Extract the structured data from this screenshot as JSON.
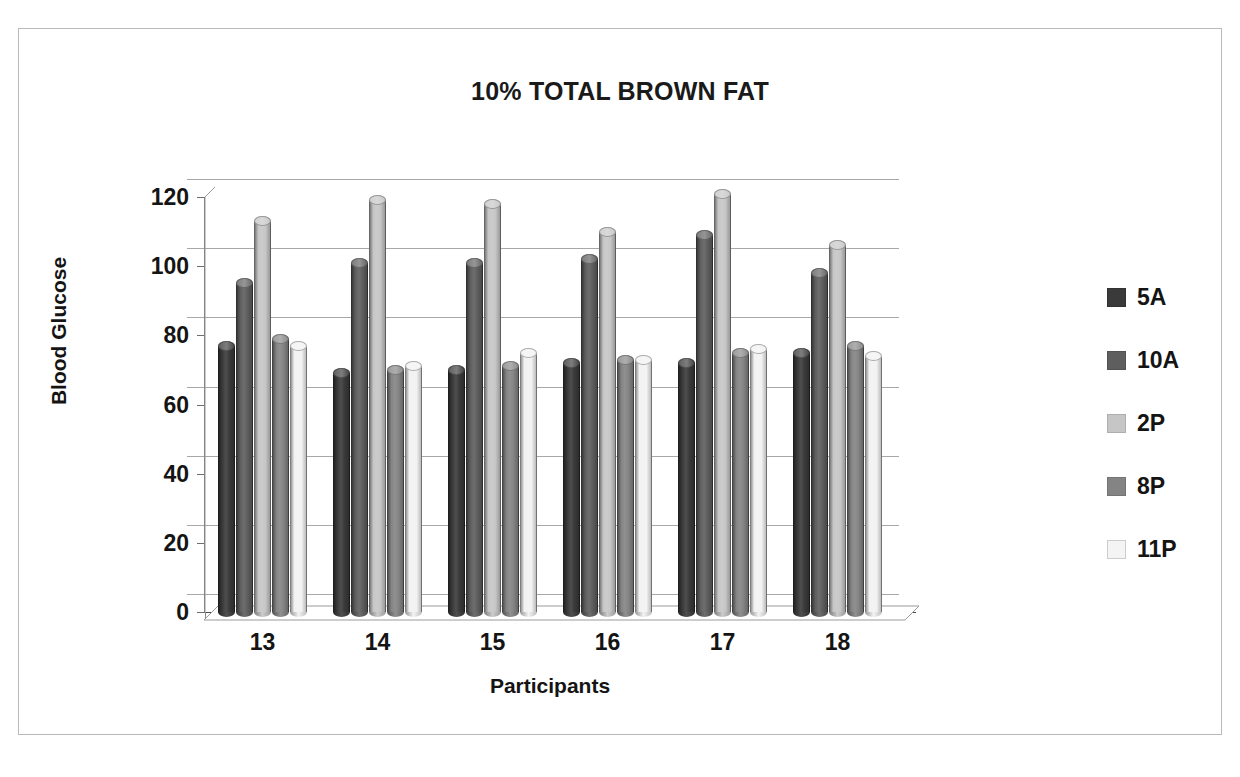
{
  "chart_data": {
    "type": "bar",
    "title": "10% TOTAL BROWN FAT",
    "xlabel": "Participants",
    "ylabel": "Blood Glucose",
    "categories": [
      "13",
      "14",
      "15",
      "16",
      "17",
      "18"
    ],
    "ylim": [
      0,
      120
    ],
    "yticks": [
      0,
      20,
      40,
      60,
      80,
      100,
      120
    ],
    "grid": true,
    "legend_position": "right",
    "style": "3d-cylinder-clustered",
    "series": [
      {
        "name": "5A",
        "color": "#3a3a3a",
        "values": [
          77,
          69,
          70,
          72,
          72,
          75
        ]
      },
      {
        "name": "10A",
        "color": "#5e5e5e",
        "values": [
          95,
          101,
          101,
          102,
          109,
          98
        ]
      },
      {
        "name": "2P",
        "color": "#c6c6c6",
        "values": [
          113,
          119,
          118,
          110,
          121,
          106
        ]
      },
      {
        "name": "8P",
        "color": "#848484",
        "values": [
          79,
          70,
          71,
          73,
          75,
          77
        ]
      },
      {
        "name": "11P",
        "color": "#f2f2f2",
        "values": [
          77,
          71,
          75,
          73,
          76,
          74
        ]
      }
    ]
  },
  "axis": {
    "y_tick_labels": [
      "0",
      "20",
      "40",
      "60",
      "80",
      "100",
      "120"
    ],
    "x_tick_labels": [
      "13",
      "14",
      "15",
      "16",
      "17",
      "18"
    ]
  },
  "legend": {
    "items": [
      {
        "label": "5A",
        "color": "#3a3a3a"
      },
      {
        "label": "10A",
        "color": "#5e5e5e"
      },
      {
        "label": "2P",
        "color": "#c6c6c6"
      },
      {
        "label": "8P",
        "color": "#848484"
      },
      {
        "label": "11P",
        "color": "#f4f4f4"
      }
    ]
  },
  "colors": {
    "gridline": "#a8a8a8",
    "axis": "#6e6e6e",
    "border": "#b9b9b9",
    "text": "#141414"
  }
}
